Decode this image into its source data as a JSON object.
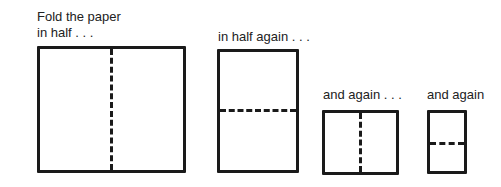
{
  "diagram": {
    "steps": [
      {
        "caption_line1": "Fold the paper",
        "caption_line2": "in half . . .",
        "fold": "vertical"
      },
      {
        "caption_line1": "in half again . . .",
        "fold": "horizontal"
      },
      {
        "caption_line1": "and again . . .",
        "fold": "vertical"
      },
      {
        "caption_line1": "and again",
        "fold": "horizontal"
      }
    ],
    "colors": {
      "line": "#1a1a1a",
      "background": "#ffffff"
    }
  }
}
